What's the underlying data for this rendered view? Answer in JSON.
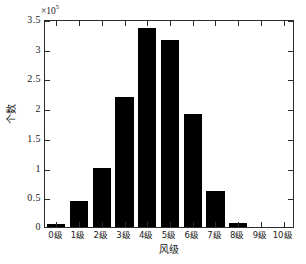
{
  "chart_data": {
    "type": "bar",
    "title": "",
    "subtitle": "",
    "xlabel": "风级",
    "ylabel": "个数",
    "categories": [
      "0级",
      "1级",
      "2级",
      "3级",
      "4级",
      "5级",
      "6级",
      "7级",
      "8级",
      "9级",
      "10级"
    ],
    "values": [
      5000,
      43000,
      99000,
      219000,
      335000,
      315000,
      191000,
      61000,
      6000,
      0,
      0
    ],
    "values_scaled": [
      0.05,
      0.43,
      0.99,
      2.19,
      3.35,
      3.15,
      1.91,
      0.61,
      0.06,
      0,
      0
    ],
    "y_exponent_label": "×10",
    "y_exponent_value": "5",
    "y_scale_multiplier": 100000,
    "ylim": [
      0,
      3.5
    ],
    "xlim_categories": 11,
    "ytick_labels": [
      "0",
      "0.5",
      "1",
      "1.5",
      "2",
      "2.5",
      "3",
      "3.5"
    ],
    "ytick_values": [
      0,
      0.5,
      1,
      1.5,
      2,
      2.5,
      3,
      3.5
    ],
    "xtick_labels": [
      "0级",
      "1级",
      "2级",
      "3级",
      "4级",
      "5级",
      "6级",
      "7级",
      "8级",
      "9级",
      "10级"
    ],
    "grid": false,
    "legend": null,
    "legend_position": "none",
    "bar_color": "#000000",
    "axis_color": "#2b2b2b",
    "background_color": "#ffffff",
    "annotations": []
  },
  "figure": {
    "exponent_prefix": "×10",
    "exponent_superscript": "5"
  }
}
